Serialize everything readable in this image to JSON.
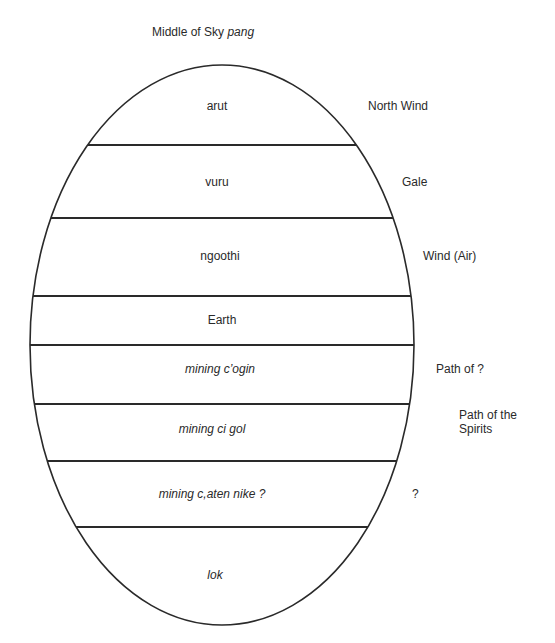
{
  "title": {
    "text": "Middle of Sky",
    "native": "pang"
  },
  "layers": [
    {
      "native": "arut",
      "italic": false,
      "gloss": "North Wind"
    },
    {
      "native": "vuru",
      "italic": false,
      "gloss": "Gale"
    },
    {
      "native": "ngoothi",
      "italic": false,
      "gloss": "Wind (Air)"
    },
    {
      "native": "Earth",
      "italic": false,
      "gloss": ""
    },
    {
      "native": "mining c’ogin",
      "italic": true,
      "gloss": "Path of ?"
    },
    {
      "native": "mining ci gol",
      "italic": true,
      "gloss": "Path of the Spirits"
    },
    {
      "native": "mining c,aten nike ?",
      "italic": true,
      "gloss": "?"
    },
    {
      "native": "lok",
      "italic": true,
      "gloss": ""
    }
  ],
  "colors": {
    "stroke": "#2a2a2a",
    "background": "#ffffff",
    "text": "#2a2a2a"
  }
}
